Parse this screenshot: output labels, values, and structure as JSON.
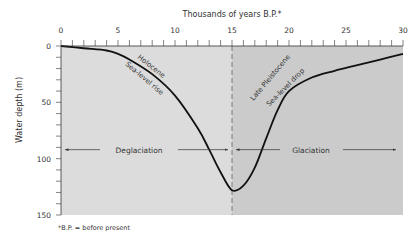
{
  "chart_data": {
    "type": "line",
    "title": "",
    "xlabel": "Thousands of years B.P.*",
    "ylabel": "Water depth (m)",
    "xlim": [
      0,
      30
    ],
    "ylim": [
      0,
      150
    ],
    "y_inverted": true,
    "x_ticks": [
      0,
      5,
      10,
      15,
      20,
      25,
      30
    ],
    "y_ticks": [
      0,
      50,
      100,
      150
    ],
    "x_axis_position": "top",
    "grid": false,
    "series": [
      {
        "name": "Sea level (water depth)",
        "x": [
          0,
          2,
          4,
          5,
          6,
          8,
          10,
          12,
          13,
          14,
          15,
          16,
          17,
          18,
          19,
          20,
          22,
          24,
          26,
          28,
          30
        ],
        "values": [
          0,
          2,
          4,
          7,
          12,
          25,
          44,
          73,
          92,
          112,
          128,
          124,
          108,
          82,
          57,
          40,
          28,
          22,
          17,
          12,
          7
        ]
      }
    ],
    "regions": [
      {
        "x_range": [
          0,
          15
        ],
        "fill": "#dcdcdc",
        "label": "Deglaciation"
      },
      {
        "x_range": [
          15,
          30
        ],
        "fill": "#cbcbcb",
        "label": "Glaciation"
      }
    ],
    "divider": {
      "x": 15,
      "style": "dashed"
    },
    "annotations": [
      {
        "text": "Holocene",
        "near_x": 8.5,
        "near_y": 22
      },
      {
        "text": "Sea-level rise",
        "near_x": 8.3,
        "near_y": 32
      },
      {
        "text": "Late Pleistocene",
        "near_x": 21.5,
        "near_y": 34
      },
      {
        "text": "Sea-level drop",
        "near_x": 23,
        "near_y": 42
      },
      {
        "text": "Deglaciation",
        "arrow": "left",
        "y": 92
      },
      {
        "text": "Glaciation",
        "arrow": "right",
        "y": 92
      }
    ],
    "footnote": "*B.P. = before present"
  }
}
